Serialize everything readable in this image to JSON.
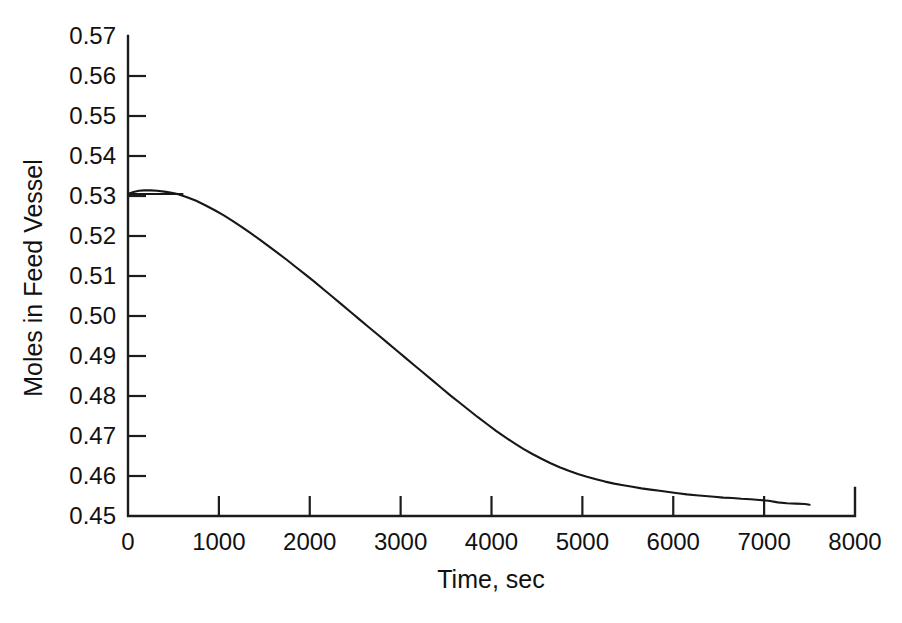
{
  "figure": {
    "background_color": "#ffffff",
    "line_color": "#171717",
    "axis_color": "#1c1c1c"
  },
  "axis_titles": {
    "x": "Time, sec",
    "y": "Moles in Feed Vessel"
  },
  "chart_data": {
    "type": "line",
    "title": "",
    "subtitle": "",
    "xlabel": "Time, sec",
    "ylabel": "Moles in Feed Vessel",
    "xlim": [
      0,
      8000
    ],
    "ylim": [
      0.45,
      0.57
    ],
    "xticks": [
      0,
      1000,
      2000,
      3000,
      4000,
      5000,
      6000,
      7000,
      8000
    ],
    "xtick_labels": [
      "0",
      "1000",
      "2000",
      "3000",
      "4000",
      "5000",
      "6000",
      "7000",
      "8000"
    ],
    "yticks": [
      0.45,
      0.46,
      0.47,
      0.48,
      0.49,
      0.5,
      0.51,
      0.52,
      0.53,
      0.54,
      0.55,
      0.56,
      0.57
    ],
    "ytick_labels": [
      "0.45",
      "0.46",
      "0.47",
      "0.48",
      "0.49",
      "0.50",
      "0.51",
      "0.52",
      "0.53",
      "0.54",
      "0.55",
      "0.56",
      "0.57"
    ],
    "grid": false,
    "legend": false,
    "legend_position": "none",
    "tick_direction": "in",
    "axis_frame": "left-bottom",
    "series": [
      {
        "name": "Moles in feed vessel",
        "x": [
          0,
          60,
          120,
          180,
          250,
          320,
          400,
          480,
          560,
          650,
          750,
          850,
          950,
          1050,
          1150,
          1250,
          1350,
          1450,
          1550,
          1650,
          1750,
          1850,
          1950,
          2050,
          2150,
          2250,
          2350,
          2450,
          2550,
          2650,
          2750,
          2850,
          2950,
          3050,
          3150,
          3250,
          3350,
          3450,
          3550,
          3650,
          3750,
          3850,
          3950,
          4050,
          4150,
          4250,
          4350,
          4450,
          4550,
          4650,
          4750,
          4850,
          4950,
          5050,
          5150,
          5250,
          5350,
          5450,
          5550,
          5650,
          5750,
          5850,
          5950,
          6050,
          6150,
          6250,
          6350,
          6450,
          6550,
          6650,
          6750,
          6850,
          6950,
          7050,
          7150,
          7250,
          7350,
          7450,
          7500
        ],
        "y": [
          0.5305,
          0.531,
          0.5313,
          0.5314,
          0.5314,
          0.5313,
          0.5311,
          0.5308,
          0.5304,
          0.5297,
          0.5288,
          0.5277,
          0.5265,
          0.5252,
          0.5238,
          0.5223,
          0.5207,
          0.5191,
          0.5174,
          0.5157,
          0.514,
          0.5122,
          0.5104,
          0.5086,
          0.5067,
          0.5048,
          0.5029,
          0.501,
          0.4991,
          0.4972,
          0.4953,
          0.4934,
          0.4915,
          0.4896,
          0.4877,
          0.4858,
          0.4839,
          0.482,
          0.4801,
          0.4783,
          0.4765,
          0.4747,
          0.473,
          0.4713,
          0.4697,
          0.4682,
          0.4668,
          0.4655,
          0.4643,
          0.4632,
          0.4622,
          0.4613,
          0.4605,
          0.4598,
          0.4592,
          0.4586,
          0.4581,
          0.4577,
          0.4573,
          0.4569,
          0.4566,
          0.4563,
          0.456,
          0.4557,
          0.4554,
          0.4552,
          0.455,
          0.4548,
          0.4546,
          0.4545,
          0.4543,
          0.4542,
          0.454,
          0.4538,
          0.4534,
          0.4532,
          0.4531,
          0.453,
          0.4528
        ],
        "start_value": 0.5305,
        "peak_value": 0.5314,
        "end_value": 0.4528,
        "end_x": 7500
      }
    ],
    "annotations": []
  }
}
